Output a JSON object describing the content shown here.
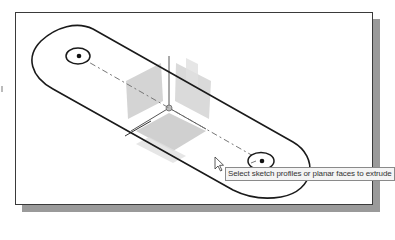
{
  "viewport": {
    "background": "#ffffff",
    "frame_color": "#3a3a3a",
    "shadow_color": "#9a9a9a"
  },
  "sketch": {
    "profile": "obround-slot",
    "holes": [
      {
        "name": "left-hole",
        "cx": 77,
        "cy": 55
      },
      {
        "name": "right-hole",
        "cx": 261,
        "cy": 160
      }
    ],
    "line_color": "#1a1a1a",
    "centerline_color": "#777777"
  },
  "triad": {
    "origin": {
      "x": 168,
      "y": 107
    },
    "plane_color": "#d4d4d4"
  },
  "cursor": {
    "icon": "arrow-pointer-icon",
    "x": 214,
    "y": 157
  },
  "tooltip": {
    "text": "Select sketch profiles or planar faces to extrude"
  }
}
